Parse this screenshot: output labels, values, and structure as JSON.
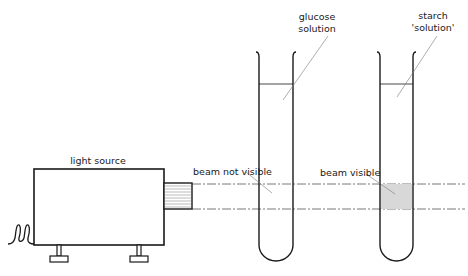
{
  "diagram": {
    "labels": {
      "light_source": "light source",
      "beam_not_visible": "beam not visible",
      "beam_visible": "beam visible",
      "glucose_line1": "glucose",
      "glucose_line2": "solution",
      "starch_line1": "starch",
      "starch_line2": "'solution'"
    },
    "tubes": [
      {
        "name": "glucose solution",
        "beam_visible": false
      },
      {
        "name": "starch 'solution'",
        "beam_visible": true
      }
    ],
    "colors": {
      "stroke": "#1a1a1a",
      "beam_dash": "#555555",
      "shading": "#d8d8d8",
      "leader": "#777777"
    }
  }
}
